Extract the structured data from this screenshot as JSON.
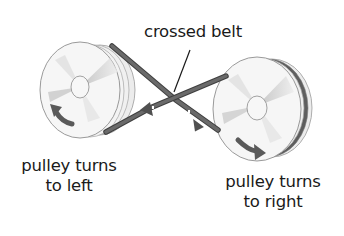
{
  "diagram": {
    "labels": {
      "belt": "crossed belt",
      "left_pulley_line1": "pulley turns",
      "left_pulley_line2": "to left",
      "right_pulley_line1": "pulley turns",
      "right_pulley_line2": "to right"
    },
    "components": [
      {
        "id": "left-pulley",
        "rotation": "counter-clockwise (to left)"
      },
      {
        "id": "right-pulley",
        "rotation": "clockwise (to right)"
      },
      {
        "id": "crossed-belt",
        "description": "belt crossing between the two pulleys"
      }
    ],
    "colors": {
      "belt": "#5a5a5a",
      "arrow": "#555555",
      "pulley_face": "#f2f2f2",
      "pulley_rim": "#e6e6e6",
      "pulley_outline": "#9a9a9a",
      "text": "#1a1a1a"
    }
  }
}
